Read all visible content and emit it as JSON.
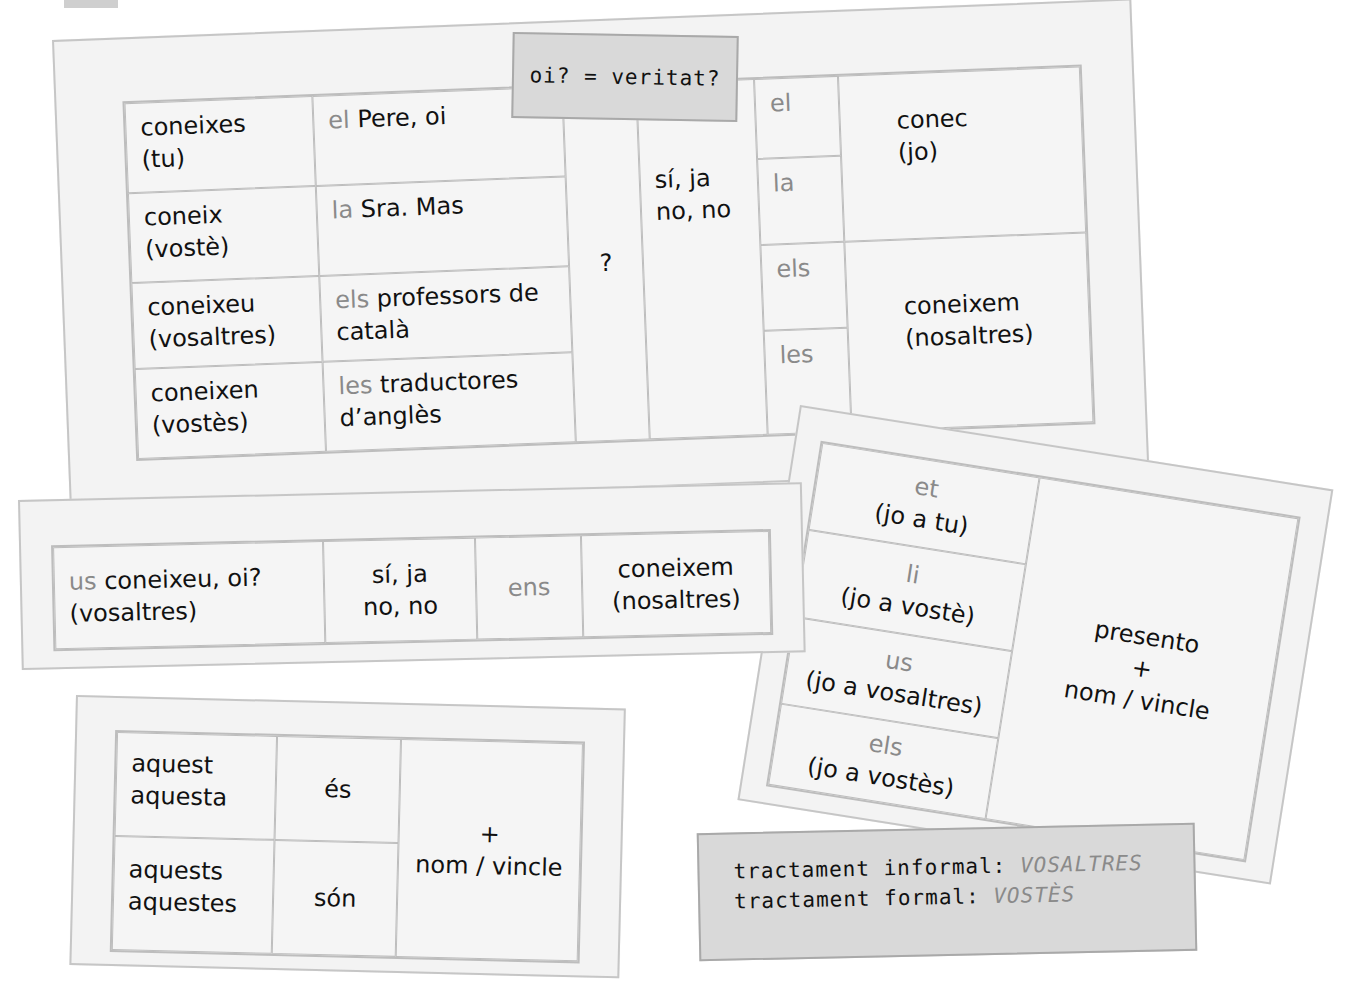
{
  "header_fragment": {
    "text": "…"
  },
  "card_conjugation": {
    "rows": [
      {
        "verb": "coneixes",
        "pronoun": "(tu)",
        "article": "el",
        "object": "Pere, oi"
      },
      {
        "verb": "coneix",
        "pronoun": "(vostè)",
        "article": "la",
        "object": "Sra. Mas"
      },
      {
        "verb": "coneixeu",
        "pronoun": "(vosaltres)",
        "article": "els",
        "object": "professors de català"
      },
      {
        "verb": "coneixen",
        "pronoun": "(vostès)",
        "article": "les",
        "object": "traductores d’anglès"
      }
    ],
    "question_mark": "?",
    "answers": [
      "sí, ja",
      "no, no"
    ],
    "object_pronouns": [
      "el",
      "la",
      "els",
      "les"
    ],
    "replies": [
      {
        "verb": "conec",
        "pronoun": "(jo)"
      },
      {
        "verb": "coneixem",
        "pronoun": "(nosaltres)"
      }
    ]
  },
  "note_oi": {
    "text": "oi? = veritat?"
  },
  "card_us": {
    "question_pronoun": "us",
    "question": "coneixeu, oi?",
    "question_subject": "(vosaltres)",
    "answers": [
      "sí, ja",
      "no, no"
    ],
    "pronoun": "ens",
    "reply_verb": "coneixem",
    "reply_subject": "(nosaltres)"
  },
  "card_demonstratives": {
    "singular": [
      "aquest",
      "aquesta"
    ],
    "singular_verb": "és",
    "plural": [
      "aquests",
      "aquestes"
    ],
    "plural_verb": "són",
    "plus": "+",
    "complement": "nom / vincle"
  },
  "card_presento": {
    "rows": [
      {
        "pronoun": "et",
        "gloss": "(jo a tu)"
      },
      {
        "pronoun": "li",
        "gloss": "(jo a vostè)"
      },
      {
        "pronoun": "us",
        "gloss": "(jo a vosaltres)"
      },
      {
        "pronoun": "els",
        "gloss": "(jo a vostès)"
      }
    ],
    "verb": "presento",
    "plus": "+",
    "complement": "nom / vincle"
  },
  "note_tractament": {
    "informal_label": "tractament informal:",
    "informal_value": "VOSALTRES",
    "formal_label": "tractament formal:",
    "formal_value": "VOSTÈS"
  },
  "colors": {
    "card_bg": "#f3f3f3",
    "border": "#bdbdbd",
    "note_bg": "#d9d9d9",
    "accent_gray": "#8a8a8a"
  }
}
